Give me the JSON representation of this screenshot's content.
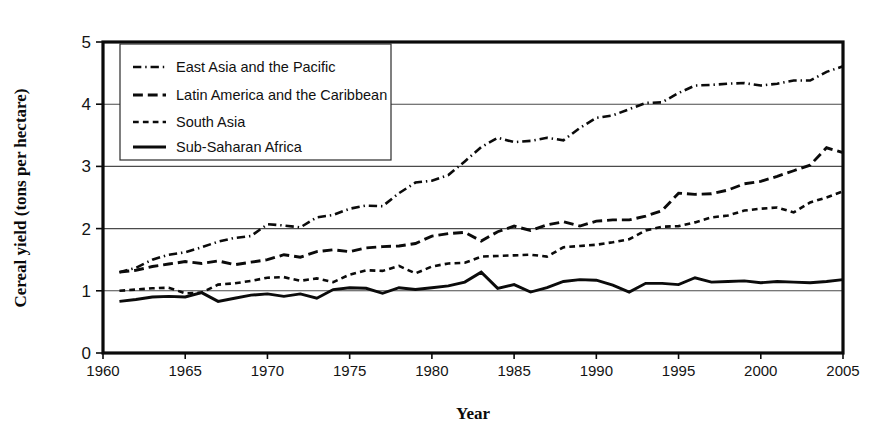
{
  "chart_data": {
    "type": "line",
    "title": "",
    "xlabel": "Year",
    "ylabel": "Cereal yield (tons per hectare)",
    "xlim": [
      1960,
      2005
    ],
    "ylim": [
      0,
      5
    ],
    "grid": true,
    "gridlines_y": [
      1,
      2,
      3,
      4
    ],
    "legend_position": "top-left",
    "x_ticks": [
      "1960",
      "1965",
      "1970",
      "1975",
      "1980",
      "1985",
      "1990",
      "1995",
      "2000",
      "2005"
    ],
    "y_ticks": [
      "0",
      "1",
      "2",
      "3",
      "4",
      "5"
    ],
    "x": [
      1961,
      1962,
      1963,
      1964,
      1965,
      1966,
      1967,
      1968,
      1969,
      1970,
      1971,
      1972,
      1973,
      1974,
      1975,
      1976,
      1977,
      1978,
      1979,
      1980,
      1981,
      1982,
      1983,
      1984,
      1985,
      1986,
      1987,
      1988,
      1989,
      1990,
      1991,
      1992,
      1993,
      1994,
      1995,
      1996,
      1997,
      1998,
      1999,
      2000,
      2001,
      2002,
      2003,
      2004,
      2005
    ],
    "series": [
      {
        "name": "East Asia and the Pacific",
        "dash": "dash-dot",
        "line_width": 2.6,
        "values": [
          1.3,
          1.37,
          1.5,
          1.58,
          1.62,
          1.7,
          1.79,
          1.85,
          1.88,
          2.07,
          2.05,
          2.02,
          2.18,
          2.22,
          2.32,
          2.37,
          2.36,
          2.57,
          2.74,
          2.77,
          2.86,
          3.08,
          3.31,
          3.46,
          3.39,
          3.41,
          3.46,
          3.42,
          3.62,
          3.78,
          3.82,
          3.92,
          4.02,
          4.03,
          4.18,
          4.3,
          4.31,
          4.33,
          4.34,
          4.3,
          4.33,
          4.38,
          4.38,
          4.52,
          4.61
        ]
      },
      {
        "name": "Latin America and the Caribbean",
        "dash": "dash",
        "line_width": 2.9,
        "values": [
          1.3,
          1.33,
          1.39,
          1.43,
          1.47,
          1.44,
          1.48,
          1.42,
          1.46,
          1.5,
          1.58,
          1.54,
          1.63,
          1.66,
          1.63,
          1.69,
          1.71,
          1.72,
          1.76,
          1.88,
          1.92,
          1.94,
          1.8,
          1.95,
          2.04,
          1.97,
          2.06,
          2.11,
          2.04,
          2.12,
          2.14,
          2.14,
          2.2,
          2.29,
          2.57,
          2.55,
          2.56,
          2.62,
          2.72,
          2.76,
          2.84,
          2.93,
          3.02,
          3.3,
          3.22
        ]
      },
      {
        "name": "South Asia",
        "dash": "short-dash",
        "line_width": 2.6,
        "values": [
          1.0,
          1.02,
          1.04,
          1.05,
          0.96,
          0.97,
          1.1,
          1.12,
          1.16,
          1.21,
          1.22,
          1.16,
          1.2,
          1.14,
          1.26,
          1.33,
          1.32,
          1.4,
          1.28,
          1.39,
          1.44,
          1.45,
          1.55,
          1.56,
          1.57,
          1.58,
          1.55,
          1.7,
          1.72,
          1.74,
          1.78,
          1.83,
          1.97,
          2.03,
          2.04,
          2.1,
          2.18,
          2.21,
          2.29,
          2.32,
          2.34,
          2.26,
          2.42,
          2.5,
          2.6
        ]
      },
      {
        "name": "Sub-Saharan Africa",
        "dash": "solid",
        "line_width": 2.9,
        "values": [
          0.83,
          0.86,
          0.9,
          0.91,
          0.9,
          0.97,
          0.83,
          0.88,
          0.93,
          0.95,
          0.91,
          0.95,
          0.88,
          1.02,
          1.05,
          1.04,
          0.96,
          1.05,
          1.02,
          1.05,
          1.08,
          1.14,
          1.3,
          1.04,
          1.1,
          0.98,
          1.05,
          1.15,
          1.18,
          1.17,
          1.09,
          0.98,
          1.12,
          1.12,
          1.1,
          1.21,
          1.14,
          1.15,
          1.16,
          1.13,
          1.15,
          1.14,
          1.13,
          1.15,
          1.18
        ]
      }
    ]
  },
  "legend": {
    "items": [
      {
        "label": "East Asia and the Pacific"
      },
      {
        "label": "Latin America and the Caribbean"
      },
      {
        "label": "South Asia"
      },
      {
        "label": "Sub-Saharan Africa"
      }
    ]
  },
  "colors": {
    "ink": "#0b0b0b",
    "grid": "#4a4a4a",
    "background": "#ffffff"
  }
}
